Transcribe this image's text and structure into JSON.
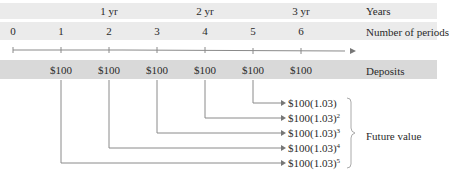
{
  "rows": {
    "years_label": "Years",
    "periods_label": "Number of periods",
    "deposits_label": "Deposits"
  },
  "years": [
    {
      "label": "1 yr",
      "x": 109
    },
    {
      "label": "2 yr",
      "x": 205
    },
    {
      "label": "3 yr",
      "x": 301
    }
  ],
  "periods": [
    "0",
    "1",
    "2",
    "3",
    "4",
    "5",
    "6"
  ],
  "deposits": [
    "$100",
    "$100",
    "$100",
    "$100",
    "$100",
    "$100"
  ],
  "future_values": [
    {
      "base": "$100(1.03)",
      "exp": ""
    },
    {
      "base": "$100(1.03)",
      "exp": "2"
    },
    {
      "base": "$100(1.03)",
      "exp": "3"
    },
    {
      "base": "$100(1.03)",
      "exp": "4"
    },
    {
      "base": "$100(1.03)",
      "exp": "5"
    }
  ],
  "future_value_label": "Future value",
  "colors": {
    "band_light": "#ebebeb",
    "band_dark": "#d9d9d9",
    "line": "#8a8a8a"
  }
}
